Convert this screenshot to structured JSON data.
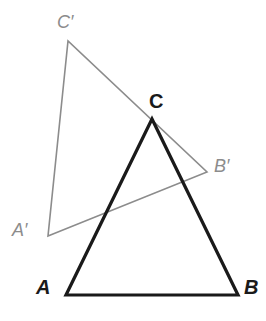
{
  "figure": {
    "width": 266,
    "height": 321,
    "background_color": "#ffffff"
  },
  "colors": {
    "primary_stroke": "#1a1a1a",
    "image_stroke": "#8c8c8c",
    "primary_label": "#1a1a1a",
    "image_label": "#8c8c8c"
  },
  "strokes": {
    "primary_width": 3.2,
    "image_width": 1.6
  },
  "chart_data": {
    "type": "diagram",
    "shapes": [
      {
        "name": "triangle-abc",
        "style": "solid-black-thick",
        "color": "#1a1a1a",
        "stroke_width": 3.2,
        "vertices": [
          {
            "label": "A",
            "x": 66,
            "y": 295
          },
          {
            "label": "B",
            "x": 238,
            "y": 295
          },
          {
            "label": "C",
            "x": 152,
            "y": 119
          }
        ]
      },
      {
        "name": "triangle-a-prime-b-prime-c-prime",
        "style": "solid-gray-thin",
        "color": "#8c8c8c",
        "stroke_width": 1.6,
        "vertices": [
          {
            "label": "A'",
            "x": 48,
            "y": 236
          },
          {
            "label": "B'",
            "x": 207,
            "y": 172
          },
          {
            "label": "C'",
            "x": 68,
            "y": 41
          }
        ]
      }
    ],
    "notes": [
      "Segment C'B' of the gray triangle passes through vertex C of the black triangle.",
      "Segment A'B' of the gray triangle crosses side AC of the black triangle."
    ]
  },
  "labels": {
    "a": {
      "text": "A",
      "x": 36,
      "y": 277
    },
    "b": {
      "text": "B",
      "x": 244,
      "y": 277
    },
    "c": {
      "text": "C",
      "x": 149,
      "y": 91
    },
    "a_prime": {
      "text": "A′",
      "x": 12,
      "y": 221
    },
    "b_prime": {
      "text": "B′",
      "x": 214,
      "y": 157
    },
    "c_prime": {
      "text": "C′",
      "x": 57,
      "y": 13
    }
  }
}
